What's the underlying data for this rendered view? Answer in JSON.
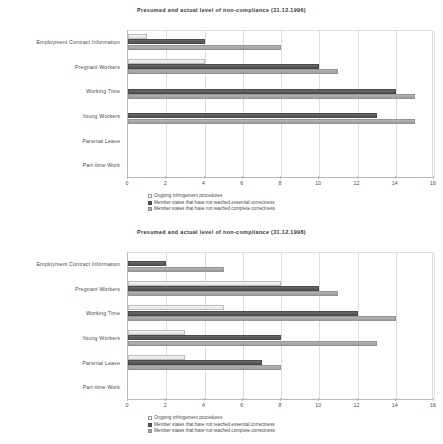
{
  "document": {
    "background_color": "#ffffff",
    "series_colors": {
      "ongoing": "#f0f0f0",
      "essential": "#585858",
      "complete": "#a8a8a8"
    }
  },
  "charts": [
    {
      "title": "Presumed and  actual level of non-compliance (31.12.1996)",
      "legend": [
        "Ongoing infringement procedures",
        "Member states that have not reached essential correctness",
        "Member states that have not reached complete correctness"
      ],
      "xticks": [
        "0",
        "2",
        "4",
        "6",
        "8",
        "10",
        "12",
        "14",
        "16"
      ],
      "categories": [
        "Employment Contract Information",
        "Pregnant Workers",
        "Working Time",
        "Young Workers",
        "Parental Leave",
        "Part-time Work"
      ]
    },
    {
      "title": "Presumed and  actual level of non-compliance (31.12.1998)",
      "legend": [
        "Ongoing infringement procedures",
        "Member states that have not reached essential correctness",
        "Member states that have not reached complete correctness"
      ],
      "xticks": [
        "0",
        "2",
        "4",
        "6",
        "8",
        "10",
        "12",
        "14",
        "16"
      ],
      "categories": [
        "Employment Contract Information",
        "Pregnant Workers",
        "Working Time",
        "Young Workers",
        "Parental Leave",
        "Part-time Work"
      ]
    }
  ],
  "chart_data": [
    {
      "type": "bar",
      "orientation": "horizontal",
      "title": "Presumed and  actual level of non-compliance (31.12.1996)",
      "xlabel": "",
      "ylabel": "",
      "xlim": [
        0,
        16
      ],
      "xticks": [
        0,
        2,
        4,
        6,
        8,
        10,
        12,
        14,
        16
      ],
      "grid": true,
      "legend_position": "bottom",
      "categories": [
        "Employment Contract Information",
        "Pregnant Workers",
        "Working Time",
        "Young Workers",
        "Parental Leave",
        "Part-time Work"
      ],
      "series": [
        {
          "name": "Ongoing infringement procedures",
          "color": "#f0f0f0",
          "values": [
            1,
            4,
            0,
            0,
            0,
            0
          ]
        },
        {
          "name": "Member states that have not reached essential correctness",
          "color": "#585858",
          "values": [
            4,
            10,
            14,
            13,
            0,
            0
          ]
        },
        {
          "name": "Member states that have not reached complete correctness",
          "color": "#a8a8a8",
          "values": [
            8,
            11,
            15,
            15,
            0,
            0
          ]
        }
      ]
    },
    {
      "type": "bar",
      "orientation": "horizontal",
      "title": "Presumed and  actual level of non-compliance (31.12.1998)",
      "xlabel": "",
      "ylabel": "",
      "xlim": [
        0,
        16
      ],
      "xticks": [
        0,
        2,
        4,
        6,
        8,
        10,
        12,
        14,
        16
      ],
      "grid": true,
      "legend_position": "bottom",
      "categories": [
        "Employment Contract Information",
        "Pregnant Workers",
        "Working Time",
        "Young Workers",
        "Parental Leave",
        "Part-time Work"
      ],
      "series": [
        {
          "name": "Ongoing infringement procedures",
          "color": "#f0f0f0",
          "values": [
            0,
            8,
            5,
            3,
            3,
            0
          ]
        },
        {
          "name": "Member states that have not reached essential correctness",
          "color": "#585858",
          "values": [
            2,
            10,
            12,
            8,
            7,
            0
          ]
        },
        {
          "name": "Member states that have not reached complete correctness",
          "color": "#a8a8a8",
          "values": [
            5,
            11,
            14,
            13,
            8,
            0
          ]
        }
      ]
    }
  ]
}
